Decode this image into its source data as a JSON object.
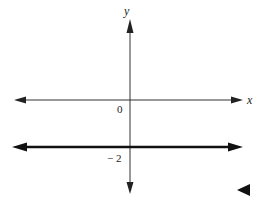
{
  "diagram": {
    "type": "coordinate-plane",
    "axes": {
      "x_label": "x",
      "y_label": "y",
      "origin_label": "0"
    },
    "line": {
      "equation": "y = -2",
      "y_intercept_label": "− 2",
      "style": "thick, arrows both ends"
    },
    "marker": "left-pointing-triangle",
    "colors": {
      "axis": "#333333",
      "line": "#111111"
    }
  }
}
